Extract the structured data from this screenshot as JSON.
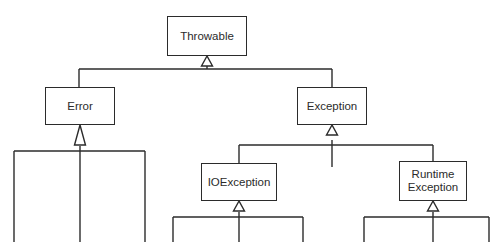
{
  "diagram": {
    "type": "uml-class-hierarchy",
    "background_color": "#ffffff",
    "line_color": "#2b2b2b",
    "box_fill_color": "#ffffff",
    "text_color": "#2b2b2b",
    "arrow_style": "hollow-triangle-generalization",
    "nodes": [
      {
        "id": "throwable",
        "label": "Throwable",
        "x": 167,
        "y": 16,
        "w": 80,
        "h": 40
      },
      {
        "id": "error",
        "label": "Error",
        "x": 45,
        "y": 87,
        "w": 70,
        "h": 38
      },
      {
        "id": "exception",
        "label": "Exception",
        "x": 297,
        "y": 87,
        "w": 70,
        "h": 38
      },
      {
        "id": "ioexception",
        "label": "IOException",
        "x": 201,
        "y": 163,
        "w": 76,
        "h": 38
      },
      {
        "id": "runtime",
        "label": "Runtime\nException",
        "x": 399,
        "y": 161,
        "w": 68,
        "h": 40
      }
    ],
    "edges": [
      {
        "from": "error",
        "to": "throwable"
      },
      {
        "from": "exception",
        "to": "throwable"
      },
      {
        "from": "ioexception",
        "to": "exception"
      },
      {
        "from": "runtime",
        "to": "exception"
      }
    ],
    "truncated_children": [
      {
        "parent": "exception",
        "count": 1,
        "note": "unlabeled center stub"
      },
      {
        "parent": "error",
        "count": 3,
        "note": "cut off at image bottom"
      },
      {
        "parent": "ioexception",
        "count": 3,
        "note": "cut off at image bottom"
      },
      {
        "parent": "runtime",
        "count": 3,
        "note": "cut off at image bottom"
      }
    ]
  }
}
